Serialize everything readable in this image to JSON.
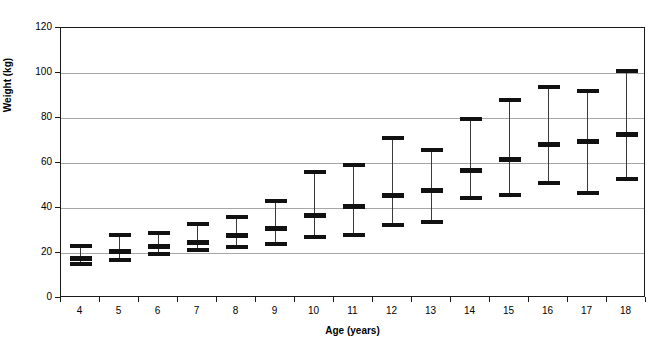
{
  "chart_data": {
    "type": "scatter",
    "title": "",
    "xlabel": "Age (years)",
    "ylabel": "Weight (kg)",
    "xlim": [
      3.5,
      18.5
    ],
    "ylim": [
      0,
      120
    ],
    "ytick_values": [
      0,
      20,
      40,
      60,
      80,
      100,
      120
    ],
    "ytick_labels": [
      "0",
      "20",
      "40",
      "60",
      "80",
      "100",
      "120"
    ],
    "grid": true,
    "grid_axis": "y",
    "legend": "none",
    "marker_style": "three-horizontal-bars-with-vertical-stem",
    "series_names": [
      "upper",
      "median",
      "lower"
    ],
    "categories": [
      4,
      5,
      6,
      7,
      8,
      9,
      10,
      11,
      12,
      13,
      14,
      15,
      16,
      17,
      18
    ],
    "xtick_labels": [
      "4",
      "5",
      "6",
      "7",
      "8",
      "9",
      "10",
      "11",
      "12",
      "13",
      "14",
      "15",
      "16",
      "17",
      "18"
    ],
    "points": [
      {
        "age": 4,
        "upper": 23,
        "median": 18,
        "lower": 15
      },
      {
        "age": 5,
        "upper": 28,
        "median": 21,
        "lower": 17
      },
      {
        "age": 6,
        "upper": 29,
        "median": 23,
        "lower": 19.5
      },
      {
        "age": 7,
        "upper": 33,
        "median": 25,
        "lower": 21.5
      },
      {
        "age": 8,
        "upper": 36,
        "median": 28,
        "lower": 22.5
      },
      {
        "age": 9,
        "upper": 43,
        "median": 31,
        "lower": 24
      },
      {
        "age": 10,
        "upper": 56,
        "median": 37,
        "lower": 27
      },
      {
        "age": 11,
        "upper": 59,
        "median": 41,
        "lower": 28
      },
      {
        "age": 12,
        "upper": 71,
        "median": 46,
        "lower": 32.5
      },
      {
        "age": 13,
        "upper": 66,
        "median": 48,
        "lower": 34
      },
      {
        "age": 14,
        "upper": 79.5,
        "median": 57,
        "lower": 44.5
      },
      {
        "age": 15,
        "upper": 88,
        "median": 62,
        "lower": 46
      },
      {
        "age": 16,
        "upper": 94,
        "median": 68.5,
        "lower": 51
      },
      {
        "age": 17,
        "upper": 92,
        "median": 70,
        "lower": 46.5
      },
      {
        "age": 18,
        "upper": 101,
        "median": 73,
        "lower": 53
      }
    ],
    "series": [
      {
        "name": "upper",
        "values": [
          23,
          28,
          29,
          33,
          36,
          43,
          56,
          59,
          71,
          66,
          79.5,
          88,
          94,
          92,
          101
        ]
      },
      {
        "name": "median",
        "values": [
          18,
          21,
          23,
          25,
          28,
          31,
          37,
          41,
          46,
          48,
          57,
          62,
          68.5,
          70,
          73
        ]
      },
      {
        "name": "lower",
        "values": [
          15,
          17,
          19.5,
          21.5,
          22.5,
          24,
          27,
          28,
          32.5,
          34,
          44.5,
          46,
          51,
          46.5,
          53
        ]
      }
    ],
    "colors": {
      "marker": "#111111",
      "stem": "#3a3a3a",
      "grid": "#a6a6a6",
      "axis": "#1a1a1a",
      "background": "#ffffff"
    }
  }
}
